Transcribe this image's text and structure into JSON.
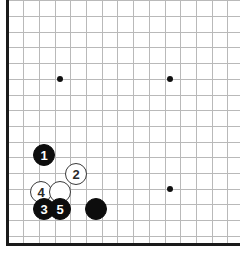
{
  "figure": {
    "type": "go-board-diagram",
    "board_size": 19,
    "visible_region": "bottom-left corner",
    "colors": {
      "background": "#ffffff",
      "grid_line": "#b9b9b9",
      "board_edge": "#1a1a1a",
      "black_stone": "#0d0d0d",
      "white_stone": "#ffffff",
      "white_stone_outline": "#3a3a3a",
      "star_point": "#111111"
    }
  },
  "geometry": {
    "origin_x": 7.5,
    "origin_y": 16.0,
    "spacing": 15.7,
    "columns": 15,
    "rows": 15,
    "left_edge_x": 6,
    "bottom_edge_y": 243
  },
  "star_points": [
    {
      "name": "star-point-upper-left",
      "x": 60,
      "y": 79
    },
    {
      "name": "star-point-upper-right",
      "x": 170,
      "y": 79
    },
    {
      "name": "star-point-lower-right",
      "x": 170,
      "y": 189
    }
  ],
  "stones": [
    {
      "id": "stone-1",
      "color": "black",
      "label": "1",
      "x": 44,
      "y": 155
    },
    {
      "id": "stone-2",
      "color": "white",
      "label": "2",
      "x": 76,
      "y": 174
    },
    {
      "id": "stone-4",
      "color": "white",
      "label": "4",
      "x": 41,
      "y": 192
    },
    {
      "id": "stone-white-plain",
      "color": "white",
      "label": "",
      "x": 60,
      "y": 192
    },
    {
      "id": "stone-3",
      "color": "black",
      "label": "3",
      "x": 44,
      "y": 209
    },
    {
      "id": "stone-5",
      "color": "black",
      "label": "5",
      "x": 60,
      "y": 209
    },
    {
      "id": "stone-black-plain",
      "color": "black",
      "label": "",
      "x": 96,
      "y": 209
    }
  ]
}
